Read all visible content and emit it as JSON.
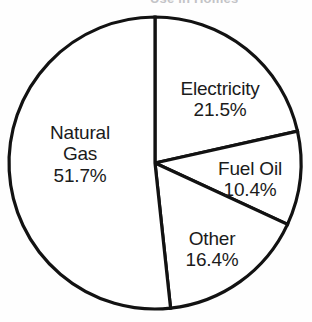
{
  "title": {
    "text": "Use in Homes",
    "visible": false,
    "note": "cropped off at top edge of image"
  },
  "colors": {
    "stroke": "#121212",
    "slice_fill": "#ffffff",
    "label_text": "#1b1b1b",
    "background": "#fefefe"
  },
  "labels": {
    "natural_gas": {
      "name_line1": "Natural",
      "name_line2": "Gas",
      "value": "51.7%"
    },
    "electricity": {
      "name": "Electricity",
      "value": "21.5%"
    },
    "fuel_oil": {
      "name": "Fuel Oil",
      "value": "10.4%"
    },
    "other": {
      "name": "Other",
      "value": "16.4%"
    }
  },
  "chart_data": {
    "type": "pie",
    "title": "Use in Homes",
    "xlabel": "",
    "ylabel": "",
    "unit": "percent",
    "total": 100.0,
    "start_angle_deg": 0,
    "direction": "clockwise",
    "legend": "none",
    "grid": false,
    "labels_inside_slices": true,
    "categories": [
      "Electricity",
      "Fuel Oil",
      "Other",
      "Natural Gas"
    ],
    "values": [
      21.5,
      10.4,
      16.4,
      51.7
    ],
    "slices": [
      {
        "label": "Electricity",
        "value": 21.5,
        "value_text": "21.5%",
        "angle_deg": 77.4,
        "start_deg": 0.0,
        "end_deg": 77.4
      },
      {
        "label": "Fuel Oil",
        "value": 10.4,
        "value_text": "10.4%",
        "angle_deg": 37.44,
        "start_deg": 77.4,
        "end_deg": 114.84
      },
      {
        "label": "Other",
        "value": 16.4,
        "value_text": "16.4%",
        "angle_deg": 59.04,
        "start_deg": 114.84,
        "end_deg": 173.88
      },
      {
        "label": "Natural Gas",
        "value": 51.7,
        "value_text": "51.7%",
        "angle_deg": 186.12,
        "start_deg": 173.88,
        "end_deg": 360.0
      }
    ],
    "geometry": {
      "center_x": 155,
      "center_y": 163,
      "radius": 146
    }
  }
}
